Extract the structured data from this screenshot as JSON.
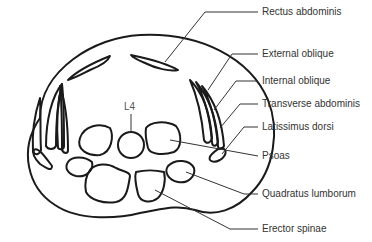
{
  "figure": {
    "vertebra_label": "L4",
    "stroke_color": "#1a1a1a",
    "label_color": "#333333",
    "labels": [
      {
        "id": "rectus-abdominis",
        "text": "Rectus abdominis",
        "x": 262,
        "y": 4
      },
      {
        "id": "external-oblique",
        "text": "External oblique",
        "x": 262,
        "y": 47
      },
      {
        "id": "internal-oblique",
        "text": "Internal oblique",
        "x": 262,
        "y": 74
      },
      {
        "id": "transverse-abdominis",
        "text": "Transverse abdominis",
        "x": 262,
        "y": 96
      },
      {
        "id": "latissimus-dorsi",
        "text": "Latissimus dorsi",
        "x": 262,
        "y": 119
      },
      {
        "id": "psoas",
        "text": "Psoas",
        "x": 262,
        "y": 148
      },
      {
        "id": "quadratus-lumborum",
        "text": "Quadratus lumborum",
        "x": 262,
        "y": 186
      },
      {
        "id": "erector-spinae",
        "text": "Erector spinae",
        "x": 262,
        "y": 221
      }
    ]
  }
}
